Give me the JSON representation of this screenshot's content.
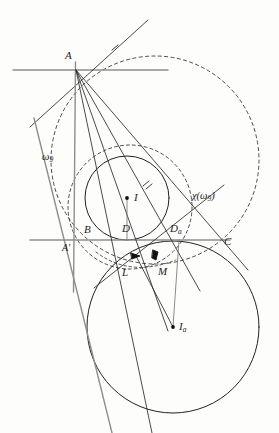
{
  "figure": {
    "background_color": "#fdfdfc",
    "stroke_color": "#2b2b2b",
    "label_color": "#1c1c1c"
  },
  "labels": {
    "vertex_a": "A",
    "vertex_b": "B",
    "vertex_c": "C",
    "vertex_a_prime": "A'",
    "incenter": "I",
    "excenter": "I",
    "excenter_sub": "a",
    "touch_d": "D",
    "touch_da": "D",
    "touch_da_sub": "a",
    "point_l": "L",
    "point_m": "M",
    "circle_omega9": "ω",
    "circle_omega9_sub": "9",
    "chi_image": "χ(ω",
    "chi_image_sub": "9",
    "chi_image_close": ")"
  },
  "points": [
    {
      "name": "A",
      "x": 76,
      "y": 70,
      "dot": false,
      "label_dx": -10,
      "label_dy": -15
    },
    {
      "name": "B",
      "x": 88,
      "y": 240,
      "dot": false,
      "label_dx": -2,
      "label_dy": -12
    },
    {
      "name": "C",
      "x": 230,
      "y": 240,
      "dot": false,
      "label_dx": -6,
      "label_dy": 3
    },
    {
      "name": "A'",
      "x": 73,
      "y": 240,
      "dot": false,
      "label_dx": -10,
      "label_dy": 12
    },
    {
      "name": "I",
      "x": 127,
      "y": 198,
      "dot": true,
      "label_dx": 7,
      "label_dy": 4
    },
    {
      "name": "Ia",
      "x": 173,
      "y": 327,
      "dot": true,
      "label_dx": 7,
      "label_dy": 5
    },
    {
      "name": "D",
      "x": 127,
      "y": 240,
      "dot": false,
      "label_dx": -4,
      "label_dy": -12
    },
    {
      "name": "Da",
      "x": 180,
      "y": 240,
      "dot": false,
      "label_dx": -9,
      "label_dy": -12
    },
    {
      "name": "L",
      "x": 135,
      "y": 256,
      "dot": true,
      "label_dx": -10,
      "label_dy": 18
    },
    {
      "name": "M",
      "x": 156,
      "y": 255,
      "dot": true,
      "label_dx": 6,
      "label_dy": 20
    }
  ],
  "circles": [
    {
      "name": "circumcircle",
      "cx": 155,
      "cy": 160,
      "r": 104,
      "dashed": true
    },
    {
      "name": "omega9",
      "cx": 130,
      "cy": 207,
      "r": 62,
      "dashed": true
    },
    {
      "name": "incircle",
      "cx": 127,
      "cy": 198,
      "r": 42,
      "dashed": false
    },
    {
      "name": "excircle",
      "cx": 173,
      "cy": 327,
      "r": 86,
      "dashed": false
    }
  ],
  "lines": [
    {
      "name": "tangent-at-A",
      "x1": 13,
      "y1": 70,
      "x2": 168,
      "y2": 70
    },
    {
      "name": "line-BC",
      "x1": 30,
      "y1": 240,
      "x2": 230,
      "y2": 240
    },
    {
      "name": "line-AB-ext",
      "x1": 33,
      "y1": 119,
      "x2": 110,
      "y2": 433
    },
    {
      "name": "line-A-Da",
      "x1": 76,
      "y1": 70,
      "x2": 196,
      "y2": 286
    },
    {
      "name": "line-A-C",
      "x1": 76,
      "y1": 70,
      "x2": 246,
      "y2": 268
    },
    {
      "name": "line-A-Aprime",
      "x1": 75,
      "y1": 62,
      "x2": 74,
      "y2": 290
    },
    {
      "name": "line-A-L",
      "x1": 76,
      "y1": 70,
      "x2": 150,
      "y2": 433
    },
    {
      "name": "line-A-I",
      "x1": 76,
      "y1": 70,
      "x2": 167,
      "y2": 330
    },
    {
      "name": "tangent-oblique",
      "x1": 34,
      "y1": 123,
      "x2": 146,
      "y2": 22
    },
    {
      "name": "chi-axis",
      "x1": 96,
      "y1": 286,
      "x2": 222,
      "y2": 186
    },
    {
      "name": "seg-I-D",
      "x1": 127,
      "y1": 198,
      "x2": 127,
      "y2": 240
    },
    {
      "name": "seg-Ia-Da",
      "x1": 173,
      "y1": 327,
      "x2": 180,
      "y2": 240
    },
    {
      "name": "seg-Ia-L",
      "x1": 173,
      "y1": 327,
      "x2": 136,
      "y2": 255
    }
  ],
  "ticks": [
    {
      "name": "tick-upper-right",
      "x": 146,
      "y": 184
    },
    {
      "name": "tick-upper-left",
      "x": 116,
      "y": 47
    }
  ]
}
